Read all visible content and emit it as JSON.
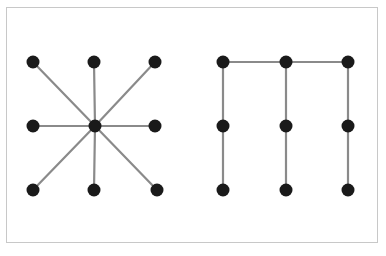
{
  "figure": {
    "title": "",
    "background_color": "#ffffff",
    "frame_color": "#c8c8c8",
    "frame_width_px": 1,
    "node_color": "#1a1a1a",
    "edge_color": "#8a8a8a",
    "node_radius_px": 6.5,
    "edge_width_px": 2.2,
    "width_px": 386,
    "height_px": 256
  },
  "graphs": [
    {
      "id": "left-graph",
      "name": "star-graph",
      "label": "",
      "description": "Star graph: one central hub connected to eight peripheral nodes arranged in a 3x3 grid pattern around it.",
      "node_count": 9,
      "edge_count": 8,
      "nodes": [
        {
          "id": "L-TL",
          "name": "node-top-left",
          "x": 33,
          "y": 62
        },
        {
          "id": "L-TC",
          "name": "node-top-center",
          "x": 94,
          "y": 62
        },
        {
          "id": "L-TR",
          "name": "node-top-right",
          "x": 155,
          "y": 62
        },
        {
          "id": "L-ML",
          "name": "node-middle-left",
          "x": 33,
          "y": 126
        },
        {
          "id": "L-C",
          "name": "node-center-hub",
          "x": 95,
          "y": 126
        },
        {
          "id": "L-MR",
          "name": "node-middle-right",
          "x": 155,
          "y": 126
        },
        {
          "id": "L-BL",
          "name": "node-bottom-left",
          "x": 33,
          "y": 190
        },
        {
          "id": "L-BC",
          "name": "node-bottom-center",
          "x": 94,
          "y": 190
        },
        {
          "id": "L-BR",
          "name": "node-bottom-right",
          "x": 157,
          "y": 190
        }
      ],
      "edges": [
        {
          "from": "L-C",
          "to": "L-TL"
        },
        {
          "from": "L-C",
          "to": "L-TC"
        },
        {
          "from": "L-C",
          "to": "L-TR"
        },
        {
          "from": "L-C",
          "to": "L-ML"
        },
        {
          "from": "L-C",
          "to": "L-MR"
        },
        {
          "from": "L-C",
          "to": "L-BL"
        },
        {
          "from": "L-C",
          "to": "L-BC"
        },
        {
          "from": "L-C",
          "to": "L-BR"
        }
      ]
    },
    {
      "id": "right-graph",
      "name": "comb-graph",
      "label": "",
      "description": "Comb / caterpillar graph: three vertical paths of three nodes each, with the three top nodes joined left-to-right by horizontal edges.",
      "node_count": 9,
      "edge_count": 8,
      "nodes": [
        {
          "id": "R-TL",
          "name": "node-top-left",
          "x": 223,
          "y": 62
        },
        {
          "id": "R-TC",
          "name": "node-top-center",
          "x": 286,
          "y": 62
        },
        {
          "id": "R-TR",
          "name": "node-top-right",
          "x": 348,
          "y": 62
        },
        {
          "id": "R-ML",
          "name": "node-middle-left",
          "x": 223,
          "y": 126
        },
        {
          "id": "R-MC",
          "name": "node-middle-center",
          "x": 286,
          "y": 126
        },
        {
          "id": "R-MR",
          "name": "node-middle-right",
          "x": 348,
          "y": 126
        },
        {
          "id": "R-BL",
          "name": "node-bottom-left",
          "x": 223,
          "y": 190
        },
        {
          "id": "R-BC",
          "name": "node-bottom-center",
          "x": 286,
          "y": 190
        },
        {
          "id": "R-BR",
          "name": "node-bottom-right",
          "x": 348,
          "y": 190
        }
      ],
      "edges": [
        {
          "from": "R-TL",
          "to": "R-TC"
        },
        {
          "from": "R-TC",
          "to": "R-TR"
        },
        {
          "from": "R-TL",
          "to": "R-ML"
        },
        {
          "from": "R-ML",
          "to": "R-BL"
        },
        {
          "from": "R-TC",
          "to": "R-MC"
        },
        {
          "from": "R-MC",
          "to": "R-BC"
        },
        {
          "from": "R-TR",
          "to": "R-MR"
        },
        {
          "from": "R-MR",
          "to": "R-BR"
        }
      ]
    }
  ]
}
